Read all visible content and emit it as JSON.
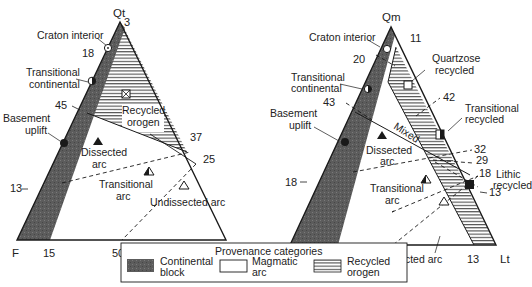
{
  "left_diagram": {
    "apex_labels": {
      "top": "Qt",
      "bottom_left": "F",
      "bottom_right": "L"
    },
    "tick_values": {
      "top": "3",
      "left_18": "18",
      "left_45": "45",
      "left_13": "13",
      "right_37": "37",
      "right_25": "25",
      "base_15": "15",
      "base_50": "50"
    },
    "field_labels": {
      "craton_interior": "Craton interior",
      "transitional_continental_1": "Transitional",
      "transitional_continental_2": "continental",
      "basement_uplift_1": "Basement",
      "basement_uplift_2": "uplift",
      "recycled_orogen_1": "Recycled",
      "recycled_orogen_2": "orogen",
      "dissected_arc_1": "Dissected",
      "dissected_arc_2": "arc",
      "transitional_arc_1": "Transitional",
      "transitional_arc_2": "arc",
      "undissected_arc": "Undissected arc"
    }
  },
  "right_diagram": {
    "apex_labels": {
      "top": "Qm",
      "bottom_left": "F",
      "bottom_right": "Lt"
    },
    "tick_values": {
      "top": "11",
      "left_20": "20",
      "left_43": "43",
      "left_18": "18",
      "right_42": "42",
      "right_32": "32",
      "right_29": "29",
      "right_18": "18",
      "right_13": "13",
      "base_23": "23",
      "base_13": "13"
    },
    "field_labels": {
      "craton_interior": "Craton interior",
      "quartzose_recycled_1": "Quartzose",
      "quartzose_recycled_2": "recycled",
      "transitional_continental_1": "Transitional",
      "transitional_continental_2": "continental",
      "basement_uplift_1": "Basement",
      "basement_uplift_2": "uplift",
      "mixed": "Mixed",
      "transitional_recycled_1": "Transitional",
      "transitional_recycled_2": "recycled",
      "dissected_arc_1": "Dissected",
      "dissected_arc_2": "arc",
      "lithic_recycled_1": "Lithic",
      "lithic_recycled_2": "recycled",
      "transitional_arc_1": "Transitional",
      "transitional_arc_2": "arc",
      "undissected_arc": "Undissected arc"
    }
  },
  "legend": {
    "title": "Provenance categories",
    "items": [
      {
        "line1": "Continental",
        "line2": "block",
        "pattern": "dark-stipple"
      },
      {
        "line1": "Magmatic",
        "line2": "arc",
        "pattern": "blank"
      },
      {
        "line1": "Recycled",
        "line2": "orogen",
        "pattern": "horizontal-lines"
      }
    ]
  },
  "colors": {
    "continental_block": "#5a5a5a",
    "line": "#1a1a1a",
    "background": "#ffffff"
  }
}
